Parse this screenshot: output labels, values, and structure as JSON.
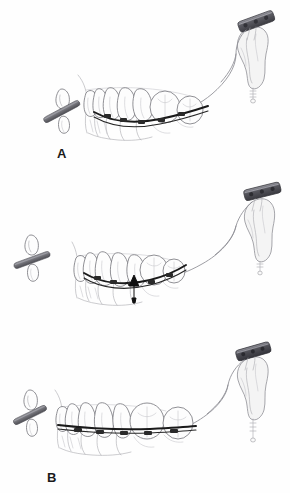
{
  "figure": {
    "background_color": "#ffffff",
    "panel_count": 3
  },
  "panels": [
    {
      "id": "panel-a",
      "label": "A",
      "caption": "Pretreatment: deep curve of Spee with miniplate anchorage and traction elastic",
      "stage": "initial",
      "arch_curve": "deep",
      "arrow_visible": false,
      "elements": {
        "miniplate": "bone-anchor-miniplate",
        "bone": "zygomatic-buttress-bone",
        "elastic": "traction-elastic-chain",
        "archwire": "curved-archwire",
        "teeth_count": 7,
        "marker_bar": "reference-marker-bar",
        "isolated_tooth": "incisor-outline"
      }
    },
    {
      "id": "panel-b",
      "label": "B",
      "caption": "Intrusive force applied: arrow indicates direction of molar intrusion",
      "stage": "active-traction",
      "arch_curve": "deep",
      "arrow_visible": true,
      "arrow_direction": "up",
      "arrow_meaning": "intrusion-force-vector",
      "elements": {
        "miniplate": "bone-anchor-miniplate",
        "bone": "zygomatic-buttress-bone",
        "elastic": "traction-elastic-chain",
        "archwire": "curved-archwire",
        "teeth_count": 7,
        "marker_bar": "reference-marker-bar",
        "isolated_tooth": "incisor-outline"
      }
    },
    {
      "id": "panel-c",
      "label": "C",
      "caption": "Post-treatment: leveled arch with flattened curve of Spee",
      "stage": "result",
      "arch_curve": "leveled",
      "arrow_visible": false,
      "elements": {
        "miniplate": "bone-anchor-miniplate",
        "bone": "zygomatic-buttress-bone",
        "elastic": "traction-elastic-chain",
        "archwire": "straight-archwire",
        "teeth_count": 7,
        "marker_bar": "reference-marker-bar",
        "isolated_tooth": "incisor-outline"
      }
    }
  ],
  "colors": {
    "background": "#ffffff",
    "outline_ink": "#6b6b6f",
    "light_ink": "#a9a9ae",
    "archwire": "#1a1a1a",
    "miniplate_dark": "#4a4a50",
    "miniplate_light": "#8b8b92",
    "marker_bar": "#6e6e74",
    "arrow": "#101010",
    "label_text": "#1a1a1a",
    "bone_fill": "#f4f4f4",
    "tooth_fill": "#fdfdfd"
  },
  "labels": {
    "a": "A",
    "b": "B",
    "c": "C"
  }
}
